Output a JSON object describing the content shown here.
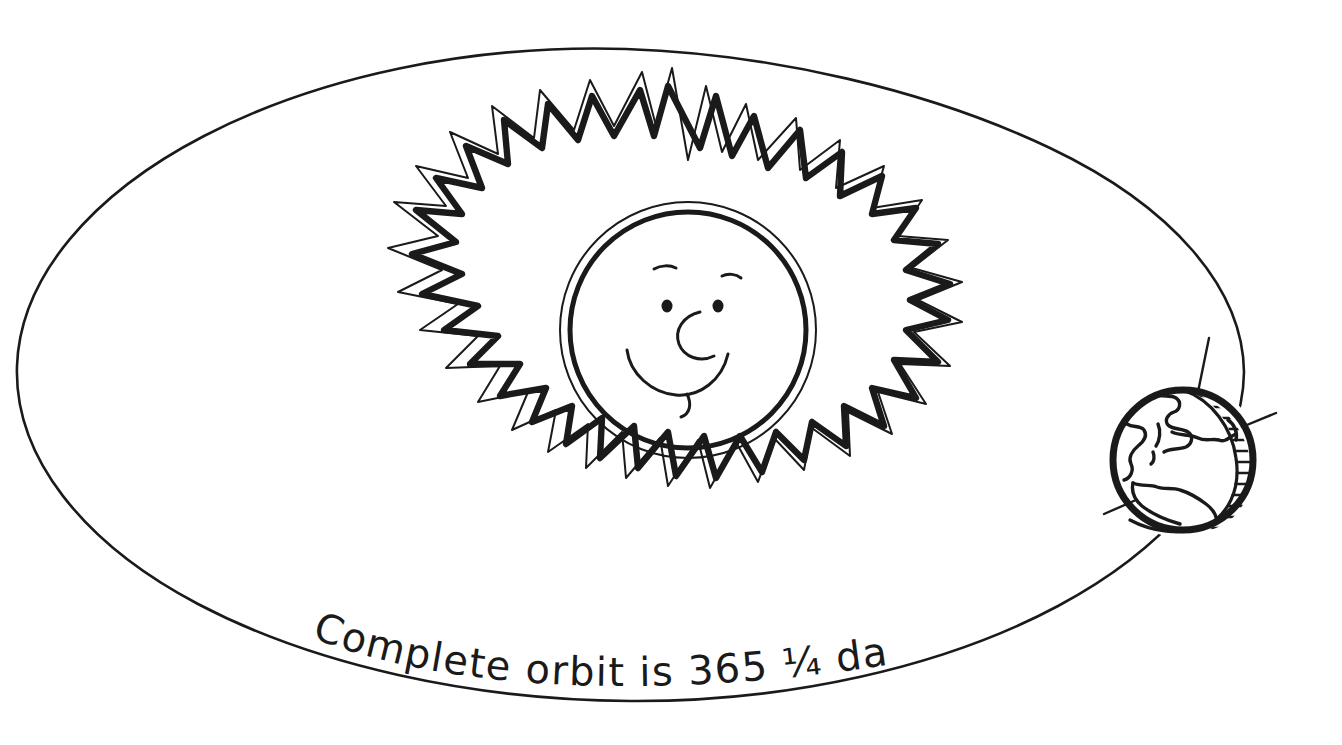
{
  "figure": {
    "background_color": "#ffffff",
    "ink_color": "#1a1a1a",
    "width": 1342,
    "height": 745,
    "style": "hand-drawn line art"
  },
  "caption": {
    "text": "Complete orbit is 365 ¼ days",
    "words": [
      "Complete",
      "orbit",
      "is",
      "365",
      "¼",
      "days"
    ],
    "orbit_period_days": 365.25,
    "orbit_period_display": "365 ¼",
    "position": "along lower arc of orbit ellipse"
  },
  "orbit": {
    "name": "orbit-ellipse",
    "shape": "ellipse",
    "center_x": 630,
    "center_y": 374,
    "radius_x": 614,
    "radius_y": 326
  },
  "sun": {
    "name": "sun",
    "label": "Sun",
    "center_x": 688,
    "center_y": 330,
    "disc_radius": 118,
    "outer_ring_radius": 128,
    "corona_points": 22,
    "has_face": true,
    "face": {
      "eyes": 2,
      "eyebrows": 2,
      "nose": 1,
      "mouth": "smile",
      "tongue": 1
    }
  },
  "earth": {
    "name": "earth",
    "label": "Earth",
    "center_x": 1183,
    "center_y": 460,
    "radius": 73,
    "axis_tilt_degrees": 23.5,
    "has_axis_line": true,
    "has_shadow": true,
    "shadow_style": "hatched crescent",
    "shadow_side": "right",
    "continents": [
      "Europe",
      "Africa",
      "Mediterranean",
      "Italy",
      "Asia Minor"
    ],
    "position_on_orbit": "right vertex of ellipse"
  }
}
